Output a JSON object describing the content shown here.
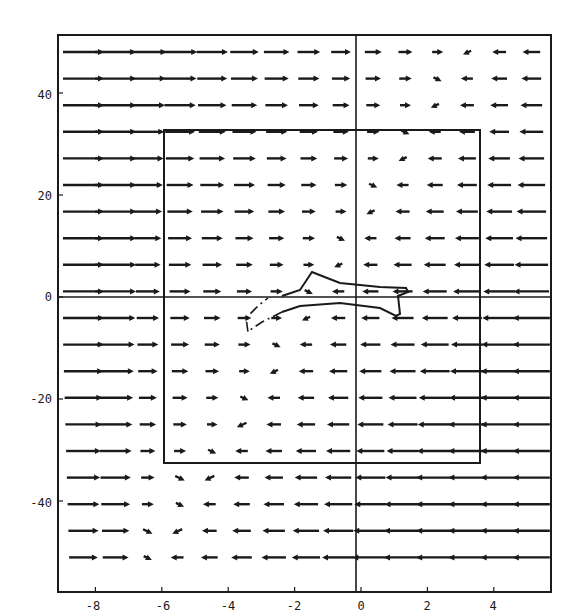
{
  "chart_data": {
    "type": "vector_field",
    "title": "",
    "xlabel": "",
    "ylabel": "",
    "xlim": [
      -9.1,
      5.8
    ],
    "ylim": [
      -52,
      50
    ],
    "x_ticks": [
      -8,
      -6,
      -4,
      -2,
      0,
      2,
      4
    ],
    "x_tick_labels": [
      "-8",
      "-6",
      "-4",
      "-2",
      "0",
      "2",
      "4"
    ],
    "y_ticks": [
      40,
      20,
      0,
      -20,
      -40
    ],
    "y_tick_labels": [
      "40",
      "20",
      "0",
      "-20",
      "-40"
    ],
    "grid": false,
    "legend": null,
    "axes_lines": {
      "x0": true,
      "y0": true
    },
    "inner_rectangle": {
      "x_min": -5.8,
      "x_max": 3.7,
      "y_min": -32.5,
      "y_max": 33
    },
    "arrow_grid": {
      "columns_x": [
        -8.5,
        -7.8,
        -7.0,
        -6.2,
        -5.5,
        -4.8,
        -4.0,
        -3.3,
        -2.6,
        -1.8,
        -1.1,
        -0.3,
        0.4,
        1.2,
        2.0,
        2.7,
        3.4,
        4.2,
        4.9,
        5.6
      ],
      "rows_y": [
        48,
        43,
        38,
        33,
        28,
        23,
        18,
        13,
        8,
        3,
        -3,
        -8,
        -13,
        -18,
        -23,
        -28,
        -33,
        -38,
        -43,
        -48
      ],
      "description": "Horizontal-dominant field: arrows point right (+x) on the left side with length decreasing toward the center; arrows point left (-x) on the right side with length increasing toward the right edge. A tilted transition band runs from upper-right (x≈4.5, y≈48) down to lower-left (x≈-5.5, y≈-48) where arrows are short and rotated."
    },
    "trajectory": {
      "description": "Closed fish-shaped orbit near origin: solid upper/right segment and dashed lower-left segment",
      "points": [
        [
          -3.4,
          -6
        ],
        [
          -2.6,
          -4.5
        ],
        [
          -1.6,
          -1.5
        ],
        [
          -0.6,
          -1.2
        ],
        [
          0.5,
          -1.8
        ],
        [
          1.1,
          -2.5
        ],
        [
          1.2,
          -3
        ],
        [
          1.0,
          0
        ],
        [
          1.5,
          2
        ],
        [
          1.3,
          2.5
        ],
        [
          0.6,
          2.5
        ],
        [
          -0.6,
          3.5
        ],
        [
          -1.4,
          5
        ],
        [
          -1.7,
          4.5
        ],
        [
          -2.0,
          1
        ],
        [
          -2.4,
          0.2
        ],
        [
          -3.4,
          -2
        ],
        [
          -3.6,
          -6
        ]
      ]
    }
  },
  "axes": {
    "x_tick_labels": [
      "-8",
      "-6",
      "-4",
      "-2",
      "0",
      "2",
      "4"
    ],
    "y_tick_labels": [
      "40",
      "20",
      "0",
      "-20",
      "-40"
    ]
  }
}
